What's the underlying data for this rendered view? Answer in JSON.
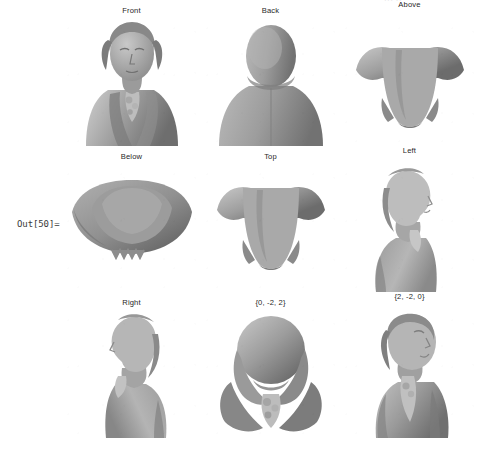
{
  "notebook": {
    "out_prompt": "Out[50]=",
    "clipped_top_label": "···  ··",
    "mesh_color": "#9a9a9a",
    "mesh_shadow_color": "#6f6f6f",
    "mesh_highlight_color": "#c4c4c4",
    "background_color": "#ffffff",
    "label_color": "#272727"
  },
  "grid": {
    "rows": 3,
    "columns": 3,
    "views": [
      {
        "label": "Front",
        "shape": "front"
      },
      {
        "label": "Back",
        "shape": "back"
      },
      {
        "label": "Above",
        "shape": "above"
      },
      {
        "label": "Below",
        "shape": "below"
      },
      {
        "label": "Top",
        "shape": "top"
      },
      {
        "label": "Left",
        "shape": "left"
      },
      {
        "label": "Right",
        "shape": "right"
      },
      {
        "label": "{0, -2, 2}",
        "shape": "v022"
      },
      {
        "label": "{2, -2, 0}",
        "shape": "v220"
      }
    ]
  }
}
